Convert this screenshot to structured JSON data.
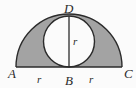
{
  "figure": {
    "kind": "geometry-diagram",
    "width": 136,
    "height": 88,
    "background_color": "#fbfbfb",
    "shade_color": "#a3a3a3",
    "stroke_color": "#2b2b2b",
    "label_color": "#2b2b2b"
  },
  "geometry": {
    "baseline": {
      "x1": 16,
      "y1": 67,
      "x2": 122,
      "y2": 67
    },
    "semicircle": {
      "cx": 69,
      "cy": 67,
      "r": 53
    },
    "inner_circle": {
      "cx": 69,
      "cy": 41.5,
      "r": 25.5
    },
    "radius_line": {
      "x1": 69,
      "y1": 67,
      "x2": 69,
      "y2": 16
    }
  },
  "labels": {
    "a": {
      "text": "A",
      "x": 8,
      "y": 78
    },
    "b": {
      "text": "B",
      "x": 65,
      "y": 85
    },
    "c": {
      "text": "C",
      "x": 124,
      "y": 78
    },
    "d": {
      "text": "D",
      "x": 64,
      "y": 13
    },
    "r_left": {
      "text": "r",
      "x": 37,
      "y": 83
    },
    "r_right": {
      "text": "r",
      "x": 89,
      "y": 83
    },
    "r_inner": {
      "text": "r",
      "x": 73,
      "y": 45
    }
  }
}
